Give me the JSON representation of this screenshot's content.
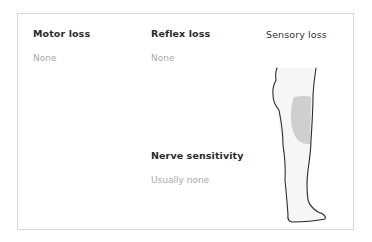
{
  "sections": {
    "motor_loss": {
      "title": "Motor loss",
      "value": "None"
    },
    "reflex_loss": {
      "title": "Reflex loss",
      "value": "None"
    },
    "sensory_loss": {
      "title": "Sensory loss"
    },
    "nerve_sensitivity": {
      "title": "Nerve sensitivity",
      "value": "Usually none"
    }
  },
  "colors": {
    "affected_area": "#cfcfcf",
    "outline": "#2b2b2b",
    "border": "#d6d6d6"
  }
}
